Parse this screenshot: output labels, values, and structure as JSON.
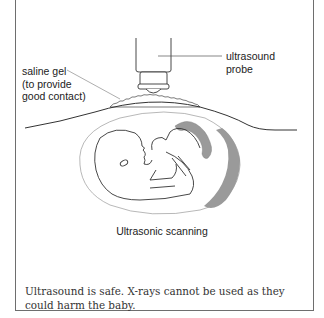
{
  "diagram": {
    "labels": {
      "probe": "ultrasound\nprobe",
      "gel": "saline gel\n(to provide\ngood contact)"
    },
    "caption": "Ultrasonic scanning",
    "colors": {
      "line": "#333333",
      "placenta": "#9a9a9a",
      "frame": "#6e6e6e"
    }
  },
  "note": {
    "text": "Ultrasound is safe. X-rays cannot be used as they could harm the baby."
  }
}
